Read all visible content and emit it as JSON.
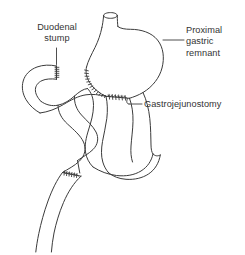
{
  "figure": {
    "background_color": "#ffffff",
    "line_color": "#3b3b3b",
    "text_color": "#333333"
  },
  "labels": {
    "duodenal_stump": "Duodenal\nstump",
    "proximal_gastric_remnant": "Proximal\ngastric\nremnant",
    "gastrojejunostomy": "Gastrojejunostomy"
  },
  "structures": [
    {
      "name": "esophagus",
      "description": "Cut esophageal end entering proximal gastric remnant at top"
    },
    {
      "name": "proximal-gastric-remnant",
      "description": "Rounded gastric pouch forming upper right of diagram"
    },
    {
      "name": "lesser-curvature-staple-line",
      "description": "Hatched staple closure along lesser curvature of gastric remnant"
    },
    {
      "name": "gastrojejunostomy-anastomosis",
      "description": "Hatched anastomosis between gastric remnant and jejunal loop"
    },
    {
      "name": "duodenal-stump",
      "description": "Closed duodenal stump loop at upper left with hatched closure"
    },
    {
      "name": "afferent-jejunal-limb",
      "description": "Jejunal limb looping from duodenal stump region downward"
    },
    {
      "name": "efferent-jejunal-limb",
      "description": "Jejunal limb descending from gastrojejunostomy"
    },
    {
      "name": "jejunojejunostomy-staple-line",
      "description": "Small hatched suture line on lower jejunal segment"
    }
  ]
}
